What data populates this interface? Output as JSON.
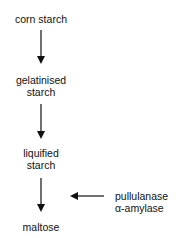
{
  "diagram": {
    "steps": [
      {
        "lines": [
          "corn starch"
        ]
      },
      {
        "lines": [
          "gelatinised",
          "starch"
        ]
      },
      {
        "lines": [
          "liquified",
          "starch"
        ]
      },
      {
        "lines": [
          "maltose"
        ]
      }
    ],
    "enzymes": {
      "lines": [
        "pullulanase",
        "α-amylase"
      ],
      "applies_to_step": 3
    },
    "colors": {
      "line": "#111111",
      "text": "#111111",
      "background": "#ffffff"
    }
  }
}
